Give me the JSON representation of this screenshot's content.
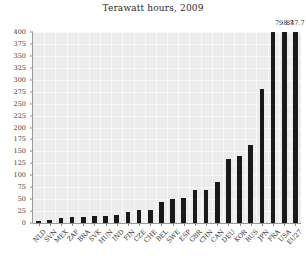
{
  "chart_data": {
    "type": "bar",
    "title": "Terawatt hours, 2009",
    "xlabel": "",
    "ylabel": "",
    "ylim": [
      0,
      400
    ],
    "ytick_step": 25,
    "yticks": [
      0,
      25,
      50,
      75,
      100,
      125,
      150,
      175,
      200,
      225,
      250,
      275,
      300,
      325,
      350,
      375,
      400
    ],
    "grid": true,
    "legend": "none",
    "bar_color": "#1a1a1a",
    "plot_background": "#ececec",
    "categories": [
      "NLD",
      "SVN",
      "MEX",
      "ZAF",
      "BRA",
      "SVK",
      "HUN",
      "IND",
      "FIN",
      "CZE",
      "CHE",
      "BEL",
      "SWE",
      "ESP",
      "GBR",
      "CHN",
      "CAN",
      "DEU",
      "KOR",
      "RUS",
      "JPN",
      "FRA",
      "USA",
      "EU27"
    ],
    "values": [
      4.0,
      5.5,
      10.1,
      12.6,
      13.0,
      14.1,
      15.4,
      16.8,
      22.6,
      27.2,
      26.3,
      45.0,
      50.0,
      52.7,
      69.1,
      70.1,
      85.3,
      134.9,
      141.1,
      163.3,
      279.8,
      409.7,
      798.7,
      847.7
    ],
    "value_labels": [
      {
        "category": "USA",
        "value": 798.7,
        "text": "798.7"
      },
      {
        "category": "EU27",
        "value": 847.7,
        "text": "847.7"
      }
    ],
    "note": "bars for FRA, USA and EU27 exceed the 400 TWh axis maximum and are clipped at the top"
  }
}
